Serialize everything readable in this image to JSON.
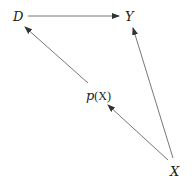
{
  "diagram": {
    "nodes": [
      {
        "id": "D",
        "label": "D",
        "x": 18,
        "y": 21
      },
      {
        "id": "Y",
        "label": "Y",
        "x": 129,
        "y": 21
      },
      {
        "id": "pX",
        "label_func": "p",
        "label_arg": "(X)",
        "x": 99,
        "y": 99
      },
      {
        "id": "X",
        "label": "X",
        "x": 176,
        "y": 175
      }
    ],
    "edges": [
      {
        "from": "D",
        "to": "Y"
      },
      {
        "from": "pX",
        "to": "D"
      },
      {
        "from": "X",
        "to": "pX"
      },
      {
        "from": "X",
        "to": "Y"
      }
    ],
    "colors": {
      "line": "#555555",
      "text": "#222222"
    }
  }
}
